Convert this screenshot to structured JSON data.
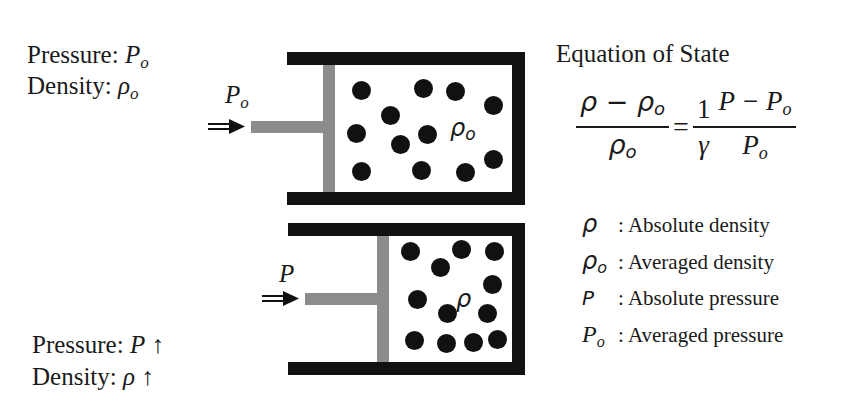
{
  "state_initial": {
    "pressure_label": "Pressure: ",
    "pressure_symbol": "P",
    "pressure_sub": "o",
    "density_label": "Density: ",
    "density_symbol": "ρ",
    "density_sub": "o"
  },
  "state_compressed": {
    "pressure_label": "Pressure: ",
    "pressure_symbol": "P",
    "pressure_arrow": "↑",
    "density_label": "Density: ",
    "density_symbol": "ρ",
    "density_arrow": "↑"
  },
  "cylinder_top": {
    "force_symbol": "P",
    "force_sub": "o",
    "gas_symbol": "ρ",
    "gas_sub": "o",
    "particle_count": 13
  },
  "cylinder_bottom": {
    "force_symbol": "P",
    "gas_symbol": "ρ",
    "particle_count": 13
  },
  "equation": {
    "title": "Equation of State",
    "lhs_numerator": "ρ − ρ",
    "lhs_numerator_sub": "o",
    "lhs_denominator": "ρ",
    "lhs_denominator_sub": "o",
    "equals": "=",
    "coef_numerator": "1",
    "coef_denominator": "γ",
    "rhs_numerator": "P − P",
    "rhs_numerator_sub": "o",
    "rhs_denominator": "P",
    "rhs_denominator_sub": "o"
  },
  "legend": [
    {
      "symbol": "ρ",
      "sub": "",
      "text": ": Absolute density"
    },
    {
      "symbol": "ρ",
      "sub": "o",
      "text": ": Averaged density"
    },
    {
      "symbol": "P",
      "sub": "",
      "text": ": Absolute pressure"
    },
    {
      "symbol": "P",
      "sub": "o",
      "text": ": Averaged pressure"
    }
  ],
  "colors": {
    "wall": "#111111",
    "piston": "#8c8c8c",
    "particle": "#111111",
    "text": "#1a1a1a"
  }
}
